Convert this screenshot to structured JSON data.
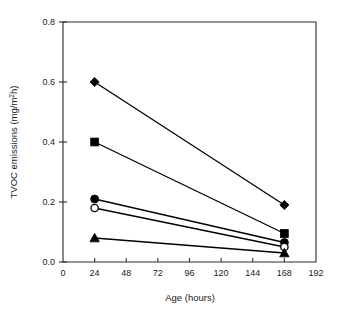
{
  "chart_data": {
    "type": "line",
    "title": "",
    "xlabel": "Age (hours)",
    "ylabel": "TVOC emissions (mg/m²h)",
    "ylabel_main": "TVOC emissions (mg/m",
    "ylabel_sup": "2",
    "ylabel_tail": "h)",
    "xlim": [
      0,
      192
    ],
    "ylim": [
      0.0,
      0.8
    ],
    "grid": false,
    "legend": "none",
    "x": [
      24,
      168
    ],
    "xticks": [
      "0",
      "24",
      "48",
      "72",
      "96",
      "120",
      "144",
      "168",
      "192"
    ],
    "xtick_values": [
      0,
      24,
      48,
      72,
      96,
      120,
      144,
      168,
      192
    ],
    "yticks": [
      "0.0",
      "0.2",
      "0.4",
      "0.6",
      "0.8"
    ],
    "ytick_values": [
      0.0,
      0.2,
      0.4,
      0.6,
      0.8
    ],
    "series": [
      {
        "name": "series-diamond",
        "marker": "filled-diamond",
        "values": [
          0.6,
          0.19
        ]
      },
      {
        "name": "series-square",
        "marker": "filled-square",
        "values": [
          0.4,
          0.095
        ]
      },
      {
        "name": "series-filled-circle",
        "marker": "filled-circle",
        "values": [
          0.21,
          0.065
        ]
      },
      {
        "name": "series-open-circle",
        "marker": "open-circle",
        "values": [
          0.18,
          0.05
        ]
      },
      {
        "name": "series-triangle",
        "marker": "filled-triangle",
        "values": [
          0.08,
          0.03
        ]
      }
    ]
  }
}
